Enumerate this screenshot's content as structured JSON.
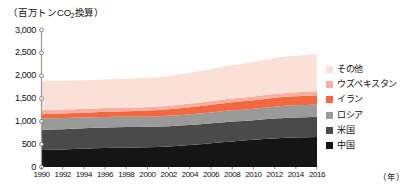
{
  "axes": {
    "y_unit_prefix": "（百万トン",
    "y_unit_sub": "2",
    "y_unit_mid": "CO",
    "y_unit_suffix": "換算）",
    "y_unit_full": "（百万トンCO2換算）",
    "y_ticks": [
      "3,000",
      "2,500",
      "2,000",
      "1,500",
      "1,000",
      "500",
      "0"
    ],
    "x_ticks": [
      "1990",
      "1992",
      "1994",
      "1996",
      "1998",
      "2000",
      "2002",
      "2004",
      "2006",
      "2008",
      "2010",
      "2012",
      "2014",
      "2016"
    ],
    "x_unit": "（年）"
  },
  "legend": {
    "items": [
      {
        "label": "その他",
        "color": "#fbe0d8"
      },
      {
        "label": "ウズベキスタン",
        "color": "#f6b0a0"
      },
      {
        "label": "イラン",
        "color": "#f4683f"
      },
      {
        "label": "ロシア",
        "color": "#9a9a9a"
      },
      {
        "label": "米国",
        "color": "#4a4a4a"
      },
      {
        "label": "中国",
        "color": "#151515"
      }
    ]
  },
  "chart_data": {
    "type": "area",
    "title": "",
    "subtitle": "",
    "xlabel": "（年）",
    "ylabel": "（百万トンCO2換算）",
    "ylim": [
      0,
      3000
    ],
    "xlim": [
      1990,
      2016
    ],
    "grid": false,
    "legend_position": "right",
    "stacked": true,
    "x": [
      1990,
      1991,
      1992,
      1993,
      1994,
      1995,
      1996,
      1997,
      1998,
      1999,
      2000,
      2001,
      2002,
      2003,
      2004,
      2005,
      2006,
      2007,
      2008,
      2009,
      2010,
      2011,
      2012,
      2013,
      2014,
      2015,
      2016
    ],
    "series": [
      {
        "name": "中国",
        "color": "#151515",
        "values": [
          370,
          378,
          385,
          392,
          400,
          408,
          415,
          420,
          424,
          428,
          433,
          440,
          450,
          465,
          482,
          500,
          520,
          540,
          560,
          578,
          595,
          612,
          626,
          638,
          645,
          650,
          655
        ]
      },
      {
        "name": "米国",
        "color": "#4a4a4a",
        "values": [
          440,
          442,
          444,
          446,
          448,
          450,
          452,
          453,
          452,
          450,
          448,
          446,
          444,
          442,
          440,
          438,
          436,
          435,
          434,
          432,
          430,
          432,
          434,
          437,
          440,
          442,
          445
        ]
      },
      {
        "name": "ロシア",
        "color": "#9a9a9a",
        "values": [
          255,
          250,
          245,
          240,
          235,
          230,
          228,
          226,
          224,
          222,
          222,
          224,
          226,
          228,
          232,
          236,
          240,
          244,
          248,
          246,
          250,
          256,
          262,
          266,
          268,
          268,
          270
        ]
      },
      {
        "name": "イラン",
        "color": "#f4683f",
        "values": [
          90,
          94,
          98,
          102,
          106,
          110,
          114,
          118,
          122,
          126,
          132,
          138,
          144,
          150,
          156,
          162,
          168,
          174,
          178,
          182,
          186,
          190,
          194,
          196,
          198,
          200,
          202
        ]
      },
      {
        "name": "ウズベキスタン",
        "color": "#f6b0a0",
        "values": [
          88,
          87,
          86,
          85,
          84,
          83,
          82,
          81,
          80,
          79,
          78,
          78,
          78,
          78,
          78,
          78,
          79,
          80,
          81,
          82,
          83,
          84,
          85,
          86,
          87,
          88,
          89
        ]
      },
      {
        "name": "その他",
        "color": "#fbe0d8",
        "values": [
          640,
          636,
          632,
          628,
          626,
          625,
          626,
          628,
          630,
          632,
          636,
          642,
          650,
          660,
          672,
          686,
          700,
          716,
          734,
          740,
          754,
          770,
          784,
          794,
          800,
          804,
          808
        ]
      }
    ]
  }
}
